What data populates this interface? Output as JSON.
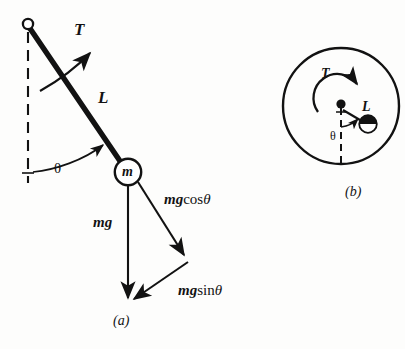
{
  "figure": {
    "background_color": "#fdfdfc",
    "ink_color": "#121212"
  },
  "panel_a": {
    "caption": "(a)",
    "labels": {
      "tension": "T",
      "length": "L",
      "mass": "m",
      "angle": "θ",
      "weight": "mg",
      "weight_normal_mg": "mg",
      "weight_normal_fn": "cos",
      "weight_normal_theta": "θ",
      "weight_tangential_mg": "mg",
      "weight_tangential_fn": "sin",
      "weight_tangential_theta": "θ"
    },
    "geometry": {
      "pivot_x": 28,
      "pivot_y": 24,
      "bob_x": 128,
      "bob_y": 172,
      "bob_radius": 13,
      "vertical_dashed_end_y": 182,
      "mg_tip_x": 128,
      "mg_tip_y": 302,
      "mgcos_tip_x": 186,
      "mgcos_tip_y": 259,
      "rod_width": 5
    }
  },
  "panel_b": {
    "caption": "(b)",
    "labels": {
      "tension": "T",
      "length": "L",
      "angle": "θ"
    },
    "geometry": {
      "circle_cx": 341,
      "circle_cy": 106,
      "circle_r": 58,
      "hub_x": 341,
      "hub_y": 104,
      "bob_x": 368,
      "bob_y": 124,
      "bob_radius": 9
    }
  }
}
